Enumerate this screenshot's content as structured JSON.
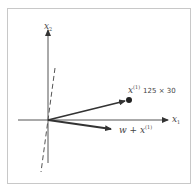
{
  "diagram": {
    "axes": {
      "x1": {
        "label": "x",
        "subscript": "1"
      },
      "x2": {
        "label": "x",
        "subscript": "2"
      }
    },
    "vectors": [
      {
        "name": "x(1)",
        "label": "x",
        "superscript": "(1)",
        "annotation": "125 × 30",
        "end_marker": "dot"
      },
      {
        "name": "w + x(1)",
        "label": "w + x",
        "superscript": "(1)"
      }
    ],
    "dashed_line": {
      "description": "decision boundary through origin"
    },
    "colors": {
      "line": "#444444",
      "border": "#c8c8c8",
      "text": "#444444"
    }
  }
}
